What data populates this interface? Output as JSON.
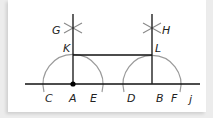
{
  "diagram": {
    "type": "geometric-construction",
    "colors": {
      "line": "#111111",
      "arc": "#9a9a9a",
      "construction_mark": "#8a8a8a",
      "point": "#000000",
      "background": "#ffffff"
    },
    "labels": {
      "G": "G",
      "H": "H",
      "K": "K",
      "L": "L",
      "C": "C",
      "A": "A",
      "E": "E",
      "D": "D",
      "B": "B",
      "F": "F",
      "J": "j"
    },
    "points": {
      "A": [
        73,
        84
      ],
      "B": [
        152,
        84
      ],
      "K": [
        73,
        55
      ],
      "L": [
        152,
        55
      ],
      "G": [
        73,
        28
      ],
      "H": [
        152,
        28
      ]
    },
    "segments": [
      {
        "name": "baseline-CJ",
        "from": [
          25,
          84
        ],
        "to": [
          200,
          84
        ]
      },
      {
        "name": "perpendicular-A",
        "from": [
          73,
          14
        ],
        "to": [
          73,
          84
        ]
      },
      {
        "name": "perpendicular-B",
        "from": [
          152,
          14
        ],
        "to": [
          152,
          84
        ]
      },
      {
        "name": "segment-KL",
        "from": [
          73,
          55
        ],
        "to": [
          152,
          55
        ]
      }
    ],
    "arcs": [
      {
        "name": "arc-centered-A",
        "center": [
          73,
          84
        ],
        "radius": 30
      },
      {
        "name": "arc-centered-B",
        "center": [
          152,
          84
        ],
        "radius": 29
      }
    ]
  }
}
